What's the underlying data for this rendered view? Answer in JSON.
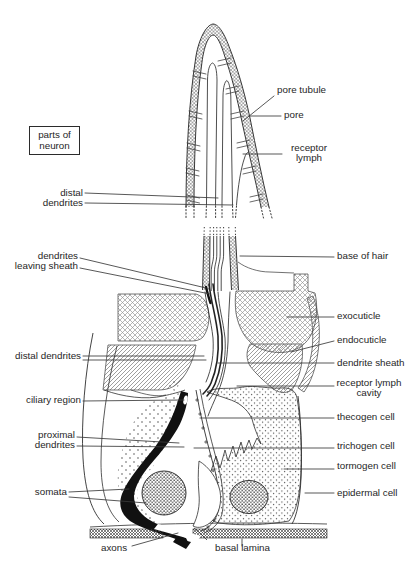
{
  "figure": {
    "kind": "anatomical line diagram"
  },
  "legend_box": {
    "lines": [
      "parts",
      "of",
      "neuron"
    ]
  },
  "labels_top": {
    "pore_tubule": "pore tubule",
    "pore": "pore",
    "receptor_lymph": [
      "receptor",
      "lymph"
    ],
    "distal_dendrites": [
      "distal",
      "dendrites"
    ],
    "dendrites_leaving_sheath": [
      "dendrites",
      "leaving sheath"
    ],
    "base_of_hair": "base of hair"
  },
  "labels_bottom": {
    "exocuticle": "exocuticle",
    "endocuticle": "endocuticle",
    "distal_dendrites": "distal dendrites",
    "dendrite_sheath": "dendrite sheath",
    "receptor_lymph_cavity": [
      "receptor lymph",
      "cavity"
    ],
    "ciliary_region": "ciliary region",
    "thecogen_cell": "thecogen cell",
    "proximal_dendrites": [
      "proximal",
      "dendrites"
    ],
    "trichogen_cell": "trichogen cell",
    "tormogen_cell": "tormogen cell",
    "somata": "somata",
    "epidermal_cell": "epidermal cell",
    "axons": "axons",
    "basal_lamina": "basal lamina"
  },
  "colors": {
    "ink": "#222222",
    "background": "#ffffff",
    "label_text": "#262626"
  }
}
